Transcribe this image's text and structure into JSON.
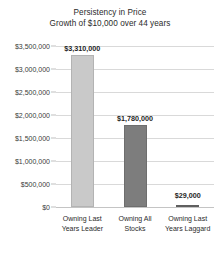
{
  "chart_data": {
    "type": "bar",
    "title": "Persistency in Price",
    "subtitle": "Growth of $10,000 over 44 years",
    "xlabel": "",
    "ylabel": "",
    "ylim": [
      0,
      3500000
    ],
    "grid": true,
    "legend": "none",
    "categories": [
      "Owning Last Years Leader",
      "Owning All Stocks",
      "Owning Last Years Laggard"
    ],
    "category_lines": [
      [
        "Owning Last",
        "Years Leader"
      ],
      [
        "Owning All",
        "Stocks"
      ],
      [
        "Owning Last",
        "Years Laggard"
      ]
    ],
    "values": [
      3310000,
      1780000,
      29000
    ],
    "value_labels": [
      "$3,310,000",
      "$1,780,000",
      "$29,000"
    ],
    "bar_colors": [
      "#c9c9c9",
      "#7d7d7d",
      "#5f5f5f"
    ],
    "ytick_values": [
      3500000,
      3000000,
      2500000,
      2000000,
      1500000,
      1000000,
      500000,
      0
    ],
    "ytick_labels": [
      "$3,500,000",
      "$3,000,000",
      "$2,500,000",
      "$2,000,000",
      "$1,500,000",
      "$1,000,000",
      "$500,000",
      "$0"
    ]
  }
}
